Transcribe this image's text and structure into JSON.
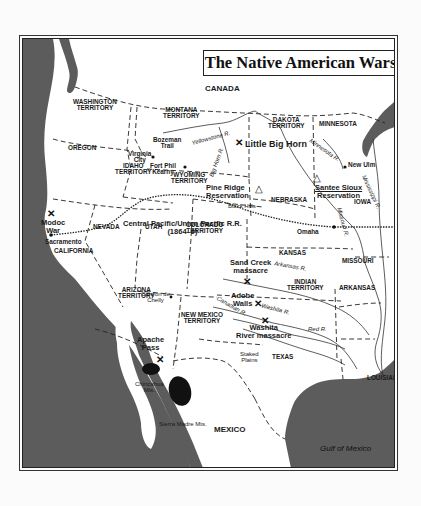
{
  "map": {
    "title": "The Native American Wars",
    "colors": {
      "water": "#5a5a5a",
      "land": "#ffffff",
      "border_line": "#222222",
      "page_bg": "#fbfbfb"
    },
    "countries": {
      "canada": "CANADA",
      "mexico": "MEXICO"
    },
    "water_bodies": {
      "gulf": "Gulf of Mexico"
    },
    "regions": {
      "washington": [
        "WASHINGTON",
        "TERRITORY"
      ],
      "montana": [
        "MONTANA",
        "TERRITORY"
      ],
      "dakota": [
        "DAKOTA",
        "TERRITORY"
      ],
      "minnesota": "MINNESOTA",
      "oregon": "OREGON",
      "idaho": [
        "IDAHO",
        "TERRITORY"
      ],
      "wyoming": [
        "WYOMING",
        "TERRITORY"
      ],
      "nebraska": "NEBRASKA",
      "iowa": "IOWA",
      "nevada": "NEVADA",
      "utah": "UTAH",
      "colorado": [
        "COLORADO",
        "TERRITORY"
      ],
      "kansas": "KANSAS",
      "missouri": "MISSOURI",
      "california": "CALIFORNIA",
      "arizona": [
        "ARIZONA",
        "TERRITORY"
      ],
      "new_mexico": [
        "NEW MEXICO",
        "TERRITORY"
      ],
      "indian": [
        "INDIAN",
        "TERRITORY"
      ],
      "arkansas": "ARKANSAS",
      "texas": "TEXAS",
      "louisiana": "LOUISIANA"
    },
    "battle_sites": {
      "little_big_horn": "Little Big Horn",
      "modoc_war": [
        "Modoc",
        "War"
      ],
      "sand_creek": [
        "Sand Creek",
        "massacre"
      ],
      "adobe_walls": [
        "Adobe",
        "Walls"
      ],
      "washita": [
        "Washita",
        "River massacre"
      ],
      "apache_pass": [
        "Apache",
        "Pass"
      ]
    },
    "reservations": {
      "pine_ridge": [
        "Pine Ridge",
        "Reservation"
      ],
      "santee_sioux": [
        "Santee Sioux",
        "Reservation"
      ]
    },
    "places": {
      "bozeman_trail": [
        "Bozeman",
        "Trail"
      ],
      "virginia_city": [
        "Virginia",
        "City"
      ],
      "fort_phil_kearny": [
        "Fort Phil",
        "Kearny"
      ],
      "new_ulm": "New Ulm",
      "sacramento": "Sacramento",
      "omaha": "Omaha",
      "canyon_de_chelly": [
        "Canyon de",
        "Chelly"
      ],
      "black_hills": "Black Hills",
      "staked_plains": [
        "Staked",
        "Plains"
      ],
      "chiricahua_mts": [
        "Chiricahua",
        "Mts."
      ],
      "sierra_madre_mts": "Sierra Madre Mts."
    },
    "railroad": {
      "name": "Central Pacific/Union Pacific R.R.",
      "years": "(1864–9)"
    },
    "rivers": {
      "yellowstone": "Yellowstone R.",
      "big_horn": "Big Horn R.",
      "minnesota": "Minnesota R.",
      "mississippi": "Mississippi R.",
      "missouri": "Missouri R.",
      "arkansas": "Arkansas R.",
      "canadian": "Canadian R.",
      "washita": "Washita R.",
      "red": "Red R."
    },
    "symbols": {
      "battle": "⚔",
      "reservation": "△"
    }
  }
}
